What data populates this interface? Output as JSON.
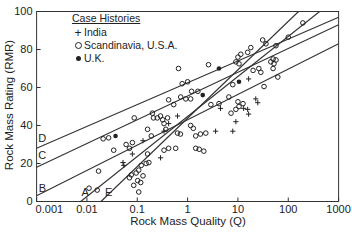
{
  "colors": {
    "foreground": "#222222",
    "background": "#ffffff",
    "line": "#333333"
  },
  "chart_data": {
    "type": "scatter",
    "title": "",
    "xlabel": "Rock Mass Quality (Q)",
    "ylabel": "Rock Mass Rating (RMR)",
    "x_scale": "log",
    "y_scale": "linear",
    "xlim": [
      0.001,
      1000
    ],
    "ylim": [
      0,
      100
    ],
    "x_ticks": [
      0.001,
      0.01,
      0.1,
      1,
      10,
      100,
      1000
    ],
    "x_tick_labels": [
      "0.001",
      "0.01",
      "0.1",
      "1",
      "10",
      "100",
      "1000"
    ],
    "y_ticks": [
      0,
      20,
      40,
      60,
      80,
      100
    ],
    "y_tick_labels": [
      "0",
      "20",
      "40",
      "60",
      "80",
      "100"
    ],
    "grid": false,
    "legend": {
      "title": "Case Histories",
      "position": "top-left"
    },
    "series": [
      {
        "name": "India",
        "marker": "plus",
        "points": [
          [
            0.13,
            32
          ],
          [
            0.34,
            37
          ],
          [
            0.63,
            45
          ],
          [
            0.052,
            20.5
          ],
          [
            0.054,
            19
          ],
          [
            0.08,
            25
          ],
          [
            3.6,
            37
          ],
          [
            16.3,
            64.5
          ],
          [
            22.6,
            54
          ],
          [
            24.8,
            52
          ],
          [
            0.42,
            41
          ],
          [
            4.5,
            49
          ],
          [
            9.1,
            42
          ],
          [
            7.9,
            37
          ],
          [
            16.3,
            46
          ],
          [
            13,
            49
          ],
          [
            15.6,
            48.5
          ],
          [
            0.29,
            23
          ]
        ]
      },
      {
        "name": "Scandinavia, U.S.A.",
        "marker": "open-circle",
        "points": [
          [
            0.021,
            33
          ],
          [
            0.027,
            33.5
          ],
          [
            0.034,
            27
          ],
          [
            0.017,
            16
          ],
          [
            0.011,
            7
          ],
          [
            0.016,
            6
          ],
          [
            0.06,
            30
          ],
          [
            0.07,
            28
          ],
          [
            0.08,
            31
          ],
          [
            0.16,
            38
          ],
          [
            0.19,
            34.5
          ],
          [
            0.21,
            44
          ],
          [
            0.32,
            43
          ],
          [
            0.4,
            44
          ],
          [
            0.34,
            41
          ],
          [
            0.37,
            38
          ],
          [
            0.16,
            25
          ],
          [
            0.17,
            20.5
          ],
          [
            0.12,
            19
          ],
          [
            0.095,
            15
          ],
          [
            0.076,
            14
          ],
          [
            0.07,
            12.5
          ],
          [
            0.085,
            8.5
          ],
          [
            0.63,
            36
          ],
          [
            0.72,
            35.5
          ],
          [
            0.58,
            28
          ],
          [
            0.42,
            28
          ],
          [
            1.15,
            40
          ],
          [
            1.3,
            38.5
          ],
          [
            1.45,
            34.5
          ],
          [
            1.45,
            28
          ],
          [
            1.7,
            27.5
          ],
          [
            2.1,
            26.5
          ],
          [
            1.8,
            35.5
          ],
          [
            2.3,
            36
          ],
          [
            0.15,
            20
          ],
          [
            0.107,
            16.5
          ],
          [
            0.13,
            13.5
          ],
          [
            0.102,
            11
          ],
          [
            0.117,
            10
          ],
          [
            0.107,
            5
          ],
          [
            0.34,
            27
          ],
          [
            2.6,
            72
          ],
          [
            10,
            76
          ],
          [
            11.4,
            77.5
          ],
          [
            9.1,
            73.5
          ],
          [
            10.5,
            72.5
          ],
          [
            15.6,
            78.5
          ],
          [
            18,
            81
          ],
          [
            31,
            85
          ],
          [
            36,
            83
          ],
          [
            45,
            73.5
          ],
          [
            57,
            74.5
          ],
          [
            26,
            70
          ],
          [
            28.5,
            68
          ],
          [
            20,
            69
          ],
          [
            7.9,
            61.5
          ],
          [
            6.6,
            55
          ],
          [
            10,
            52.5
          ],
          [
            12.6,
            51.5
          ],
          [
            0.66,
            70
          ],
          [
            0.73,
            55
          ],
          [
            0.92,
            54
          ],
          [
            0.42,
            53.5
          ],
          [
            2.9,
            51
          ],
          [
            4.2,
            51.5
          ],
          [
            33,
            60.5
          ],
          [
            62,
            65.5
          ],
          [
            1.2,
            58
          ],
          [
            0.78,
            62
          ],
          [
            1.0,
            63
          ],
          [
            1.6,
            58
          ],
          [
            1.15,
            54
          ],
          [
            0.53,
            51
          ],
          [
            0.2,
            46.5
          ],
          [
            0.25,
            44
          ],
          [
            0.29,
            45
          ],
          [
            0.087,
            44
          ],
          [
            7.3,
            46.5
          ],
          [
            9.1,
            48.5
          ],
          [
            195,
            94
          ],
          [
            100,
            86.5
          ],
          [
            57,
            82
          ],
          [
            50,
            75
          ],
          [
            52,
            72.5
          ],
          [
            50,
            70
          ],
          [
            10.5,
            50
          ]
        ]
      },
      {
        "name": "U.K.",
        "marker": "filled-circle",
        "points": [
          [
            0.037,
            34.5
          ],
          [
            4.2,
            70
          ],
          [
            2.0,
            56
          ],
          [
            10.5,
            63
          ]
        ]
      }
    ],
    "lines": [
      {
        "label": "A",
        "from": [
          0.0075,
          0
        ],
        "to": [
          420,
          100
        ],
        "label_at": [
          0.0092,
          4.5
        ]
      },
      {
        "label": "B",
        "from": [
          0.001,
          3
        ],
        "to": [
          1000,
          83
        ],
        "label_at": [
          0.0013,
          7
        ]
      },
      {
        "label": "C",
        "from": [
          0.001,
          18
        ],
        "to": [
          1000,
          93
        ],
        "label_at": [
          0.0013,
          24
        ]
      },
      {
        "label": "D",
        "from": [
          0.001,
          28
        ],
        "to": [
          1000,
          97
        ],
        "label_at": [
          0.0013,
          33
        ]
      },
      {
        "label": "E",
        "from": [
          0.019,
          0
        ],
        "to": [
          160,
          100
        ],
        "label_at": [
          0.027,
          4.5
        ]
      }
    ]
  }
}
